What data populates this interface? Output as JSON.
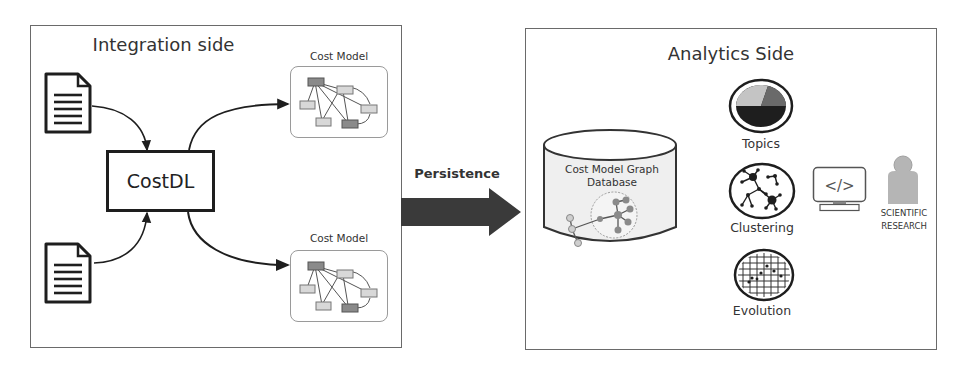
{
  "integration_panel": {
    "title": "Integration side",
    "input_documents": [
      {
        "name": "document-1",
        "icon": "document-icon"
      },
      {
        "name": "document-2",
        "icon": "document-icon"
      }
    ],
    "processor": {
      "label": "CostDL"
    },
    "outputs": [
      {
        "label": "Cost Model",
        "icon": "graph-icon"
      },
      {
        "label": "Cost Model",
        "icon": "graph-icon"
      }
    ]
  },
  "connector": {
    "label": "Persistence",
    "icon": "right-arrow-icon",
    "color": "#3a3a3a"
  },
  "analytics_panel": {
    "title": "Analytics Side",
    "database": {
      "label_line1": "Cost Model Graph",
      "label_line2": "Database",
      "icon": "database-cylinder-icon"
    },
    "analyses": [
      {
        "label": "Topics",
        "icon": "pie-chart-icon"
      },
      {
        "label": "Clustering",
        "icon": "cluster-network-icon"
      },
      {
        "label": "Evolution",
        "icon": "grid-plot-icon"
      }
    ],
    "tool": {
      "icon": "code-monitor-icon",
      "glyph": "</>"
    },
    "user": {
      "label_line1": "SCIENTIFIC",
      "label_line2": "RESEARCH",
      "icon": "person-icon"
    }
  },
  "colors": {
    "border": "#6a6a6a",
    "dark": "#1e1e1e",
    "node_dark": "#8a8a8a",
    "node_light": "#d8d8d8",
    "db_fill": "#efefef",
    "person": "#b5b5b5"
  }
}
